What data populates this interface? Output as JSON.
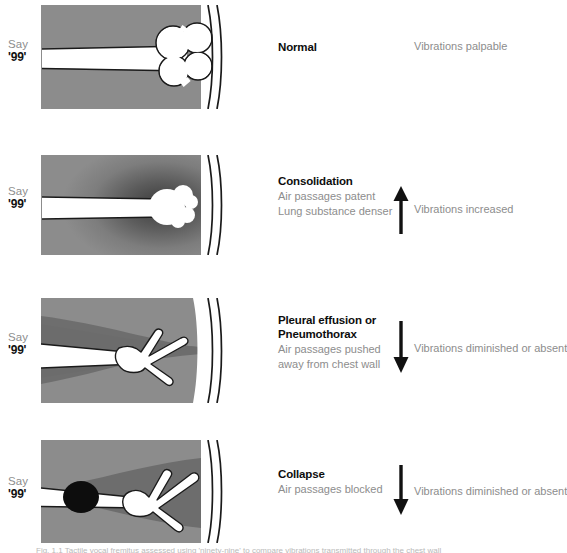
{
  "figure": {
    "say_label": "Say",
    "say_number": "'99'",
    "caption": "Fig. 1.1 Tactile vocal fremitus assessed using 'ninety-nine' to compare vibrations transmitted through the chest wall"
  },
  "colors": {
    "lung_gray": "#8c8c8c",
    "lung_dark_gray": "#6d6d6d",
    "airway_white": "#ffffff",
    "outline_black": "#1a1a1a",
    "blockage_black": "#0d0d0d",
    "title_text": "#0d0d0d",
    "muted_text": "#8d8d8d"
  },
  "panels": [
    {
      "id": "normal",
      "title": "Normal",
      "subtitle_lines": [],
      "arrow": "none",
      "arrow_name": "no-arrow",
      "vibration": "Vibrations palpable"
    },
    {
      "id": "consolidation",
      "title": "Consolidation",
      "subtitle_lines": [
        "Air passages patent",
        "Lung substance denser"
      ],
      "arrow": "up",
      "arrow_name": "arrow-up-icon",
      "vibration": "Vibrations increased"
    },
    {
      "id": "pleural-effusion-pneumothorax",
      "title": "Pleural effusion or\nPneumothorax",
      "title_lines": [
        "Pleural effusion or",
        "Pneumothorax"
      ],
      "subtitle_lines": [
        "Air passages pushed",
        "away from chest wall"
      ],
      "arrow": "down",
      "arrow_name": "arrow-down-icon",
      "vibration": "Vibrations diminished or absent"
    },
    {
      "id": "collapse",
      "title": "Collapse",
      "subtitle_lines": [
        "Air passages blocked"
      ],
      "arrow": "down",
      "arrow_name": "arrow-down-icon",
      "vibration": "Vibrations diminished or absent"
    }
  ]
}
